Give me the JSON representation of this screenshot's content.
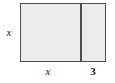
{
  "figure": {
    "type": "geometry-diagram",
    "shape": "rectangle",
    "fill_color": "#ececec",
    "stroke_color": "#4d4d4d",
    "background_color": "#ffffff",
    "text_color": "#1a1a1a"
  },
  "labels": {
    "height": "x",
    "left_width": "x",
    "right_width": "3"
  },
  "chart_data": {
    "type": "diagram",
    "title": "",
    "shapes": [
      {
        "name": "outer-rectangle",
        "kind": "rect",
        "x": 20,
        "y": 3,
        "width": 86,
        "height": 59,
        "fill": "#ececec",
        "stroke": "#4d4d4d"
      },
      {
        "name": "vertical-divider",
        "kind": "line",
        "x1": 80,
        "y1": 3,
        "x2": 80,
        "y2": 62,
        "stroke": "#4d4d4d"
      }
    ],
    "annotations": [
      {
        "name": "height-label",
        "text": "x",
        "x": 9,
        "y": 32,
        "italic": true
      },
      {
        "name": "left-width-label",
        "text": "x",
        "x": 48,
        "y": 71,
        "italic": true
      },
      {
        "name": "right-width-label",
        "text": "3",
        "x": 93,
        "y": 71,
        "italic": false
      }
    ]
  }
}
